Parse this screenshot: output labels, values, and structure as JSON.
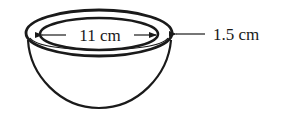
{
  "figure": {
    "inner_diameter_label": "11 cm",
    "thickness_label": "1.5 cm",
    "stroke_color": "#1a1a1a",
    "background": "#ffffff"
  }
}
